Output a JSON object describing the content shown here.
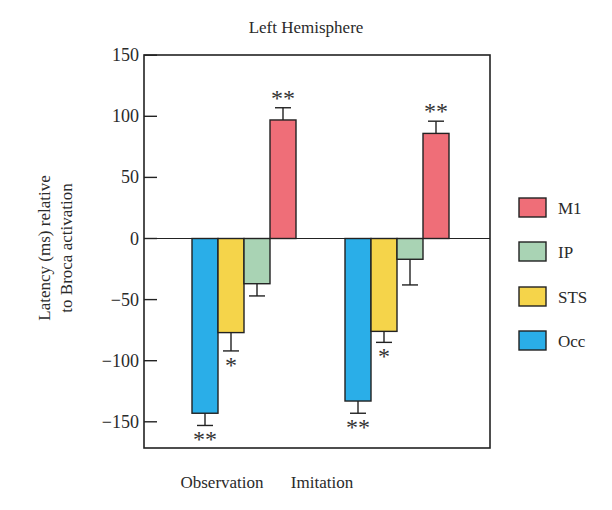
{
  "chart_data": {
    "type": "bar",
    "title": "Left Hemisphere",
    "xlabel": "",
    "ylabel": "Latency (ms) relative to Broca activation",
    "ylabel_lines": [
      "Latency (ms) relative",
      "to Broca activation"
    ],
    "ylim": [
      -170,
      150
    ],
    "yticks": [
      150,
      100,
      50,
      0,
      -50,
      -100,
      -150
    ],
    "ytick_labels": [
      "150",
      "100",
      "50",
      "0",
      "−50",
      "−100",
      "−150"
    ],
    "categories": [
      "Observation",
      "Imitation"
    ],
    "grid": false,
    "legend_position": "right",
    "series": [
      {
        "name": "Occ",
        "color": "#2aaee8",
        "values": [
          -143,
          -133
        ],
        "errors": [
          10,
          10
        ],
        "significance": [
          "**",
          "**"
        ]
      },
      {
        "name": "STS",
        "color": "#f5d44a",
        "values": [
          -77,
          -76
        ],
        "errors": [
          15,
          9
        ],
        "significance": [
          "*",
          "*"
        ]
      },
      {
        "name": "IP",
        "color": "#a9d3b4",
        "values": [
          -37,
          -17
        ],
        "errors": [
          10,
          21
        ],
        "significance": [
          "",
          ""
        ]
      },
      {
        "name": "M1",
        "color": "#ef6e78",
        "values": [
          97,
          86
        ],
        "errors": [
          10,
          10
        ],
        "significance": [
          "**",
          "**"
        ]
      }
    ],
    "legend_order": [
      "M1",
      "IP",
      "STS",
      "Occ"
    ]
  }
}
